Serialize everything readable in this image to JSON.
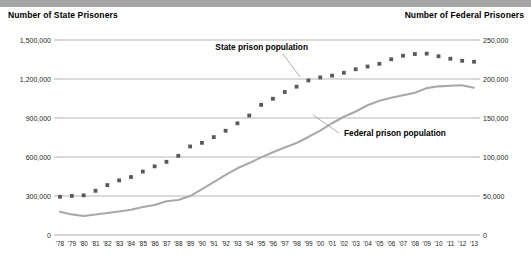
{
  "header": {
    "left_axis_title": "Number of State Prisoners",
    "right_axis_title": "Number of Federal Prisoners"
  },
  "chart_data": {
    "type": "line",
    "title": "",
    "xlabel": "",
    "grid": true,
    "legend_position": "inline-annotations",
    "categories": [
      "'78",
      "'79",
      "'80",
      "'81",
      "'82",
      "'83",
      "'84",
      "'85",
      "'86",
      "'87",
      "'88",
      "'89",
      "'90",
      "'91",
      "'92",
      "'93",
      "'94",
      "'95",
      "'96",
      "'97",
      "'98",
      "'99",
      "'00",
      "'01",
      "'02",
      "'03",
      "'04",
      "'05",
      "'06",
      "'07",
      "'08",
      "'09",
      "'10",
      "'11",
      "'12",
      "'13"
    ],
    "left_axis": {
      "label": "Number of State Prisoners",
      "ylim": [
        0,
        1500000
      ],
      "ticks": [
        0,
        300000,
        600000,
        900000,
        1200000,
        1500000
      ],
      "tick_labels": [
        "0",
        "300,000",
        "600,000",
        "900,000",
        "1,200,000",
        "1,500,000"
      ]
    },
    "right_axis": {
      "label": "Number of Federal Prisoners",
      "ylim": [
        0,
        250000
      ],
      "ticks": [
        0,
        50000,
        100000,
        150000,
        200000,
        250000
      ],
      "tick_labels": [
        "0",
        "50,000",
        "100,000",
        "150,000",
        "200,000",
        "250,000"
      ]
    },
    "series": [
      {
        "name": "State prison population",
        "axis": "left",
        "style": "dotted",
        "color": "#58595b",
        "annotation": "State prison population",
        "values": [
          294000,
          301000,
          305000,
          340000,
          384000,
          420000,
          446000,
          488000,
          528000,
          563000,
          609000,
          681000,
          709000,
          753000,
          802000,
          859000,
          919000,
          1001000,
          1048000,
          1100000,
          1141000,
          1189000,
          1212000,
          1226000,
          1248000,
          1275000,
          1296000,
          1317000,
          1352000,
          1379000,
          1392000,
          1395000,
          1375000,
          1356000,
          1340000,
          1333000
        ]
      },
      {
        "name": "Federal prison population",
        "axis": "right",
        "style": "solid",
        "color": "#a7a9ac",
        "annotation": "Federal prison population",
        "values": [
          29800,
          26400,
          24300,
          26200,
          28100,
          30200,
          32300,
          36000,
          38500,
          43200,
          44800,
          49900,
          58800,
          67800,
          77000,
          85500,
          92200,
          99500,
          106000,
          112300,
          118000,
          125700,
          133900,
          143300,
          151600,
          158400,
          166300,
          172200,
          176000,
          179200,
          182300,
          188300,
          190600,
          191400,
          192000,
          188900
        ]
      }
    ]
  }
}
